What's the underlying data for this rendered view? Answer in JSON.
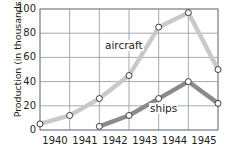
{
  "chart_data": {
    "type": "line",
    "title": "",
    "xlabel": "",
    "ylabel": "Production (in thousands)",
    "xlim": [
      1939.5,
      1945.5
    ],
    "ylim": [
      0,
      100
    ],
    "yticks": [
      0,
      20,
      40,
      60,
      80,
      100
    ],
    "xticks": [
      "1940",
      "1941",
      "1942",
      "1943",
      "1944",
      "1945"
    ],
    "grid": true,
    "legend_position": "inline-annotation",
    "x": [
      1939.5,
      1940.5,
      1941.5,
      1942.5,
      1943.5,
      1944.5,
      1945.5
    ],
    "series": [
      {
        "name": "aircraft",
        "color": "#c9c9c9",
        "marker": "open-circle",
        "values": [
          5,
          12,
          26,
          45,
          85,
          97,
          50
        ]
      },
      {
        "name": "ships",
        "color": "#8a8a8a",
        "marker": "open-circle",
        "x": [
          1941.5,
          1942.5,
          1943.5,
          1944.5,
          1945.5
        ],
        "values": [
          3,
          12,
          26,
          40,
          22
        ]
      }
    ],
    "annotations": [
      {
        "text": "aircraft",
        "x": 1942.0,
        "y": 62
      },
      {
        "text": "ships",
        "x": 1943.6,
        "y": 18
      }
    ]
  },
  "axis": {
    "y_title": "Production (in thousands)",
    "y_labels": {
      "t0": "0",
      "t20": "20",
      "t40": "40",
      "t60": "60",
      "t80": "80",
      "t100": "100"
    },
    "x_labels": {
      "c0": "1940",
      "c1": "1941",
      "c2": "1942",
      "c3": "1943",
      "c4": "1944",
      "c5": "1945"
    }
  },
  "labels": {
    "aircraft": "aircraft",
    "ships": "ships"
  },
  "colors": {
    "aircraft_line": "#c9c9c9",
    "ships_line": "#8a8a8a",
    "grid": "#9a9fb0",
    "frame": "#8b90a0",
    "text": "#231f20",
    "marker_fill": "#ffffff",
    "marker_stroke": "#3a3a3a"
  }
}
